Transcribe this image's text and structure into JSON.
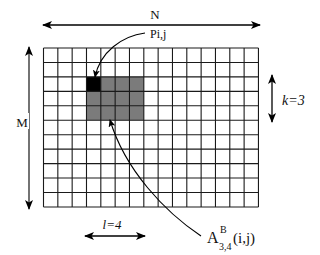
{
  "diagram": {
    "grid": {
      "columns": 15,
      "rows": 11,
      "x": 43.5,
      "y": 48,
      "cell_w": 14.33,
      "cell_h": 14.45,
      "line_color": "#1a1a1a",
      "background": "#ffffff"
    },
    "block": {
      "col": 3,
      "row": 2,
      "width_cells": 4,
      "height_cells": 3,
      "fill": "#7b7b7b"
    },
    "pixel": {
      "col": 3,
      "row": 2,
      "fill": "#000000"
    },
    "labels": {
      "n": "N",
      "m": "M",
      "k": "k=3",
      "l": "l=4",
      "pixel": "Pi,j",
      "block_base": "A",
      "block_sup": "B",
      "block_sub": "3,4",
      "block_args": "(i,j)"
    },
    "arrows": {
      "n_arrow": {
        "x1": 43,
        "y1": 25,
        "x2": 260,
        "y2": 25
      },
      "m_arrow": {
        "x1": 29,
        "y1": 47,
        "x2": 29,
        "y2": 209
      },
      "k_arrow": {
        "x1": 272,
        "y1": 75,
        "x2": 272,
        "y2": 122
      },
      "l_arrow": {
        "x1": 85,
        "y1": 236,
        "x2": 145,
        "y2": 236
      }
    }
  }
}
